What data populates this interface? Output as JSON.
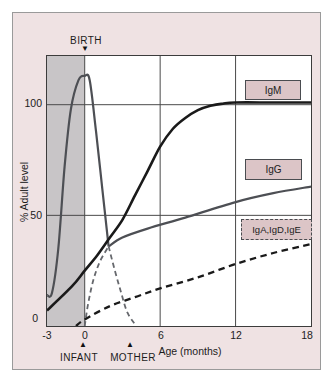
{
  "figure": {
    "markers": {
      "birth": {
        "label": "BIRTH",
        "icon": "▼"
      },
      "infant": {
        "label": "INFANT",
        "icon": "▲"
      },
      "mother": {
        "label": "MOTHER",
        "icon": "▲"
      }
    }
  },
  "axes": {
    "y_label": "% Adult level",
    "x_label": "Age (months)",
    "y_ticks": [
      "100",
      "50",
      "0"
    ],
    "x_ticks": [
      "-3",
      "0",
      "6",
      "12",
      "18"
    ]
  },
  "legend": [
    {
      "label": "IgM"
    },
    {
      "label": "IgG"
    },
    {
      "label": "IgA,IgD,IgE"
    }
  ],
  "colors": {
    "panel_bg": "#efe2e3",
    "prenatal_shade": "#c8c5c7",
    "grid": "#4a4a4a",
    "igm_line": "#1a1a1a",
    "igg_line": "#4d4f54",
    "dashed_gray": "#66686d",
    "legend_fill": "#dcc5c7"
  },
  "chart_data": {
    "type": "line",
    "xlabel": "Age (months)",
    "ylabel": "% Adult level",
    "xlim": [
      -3,
      18
    ],
    "ylim": [
      0,
      122
    ],
    "grid_x": [
      0,
      6,
      12
    ],
    "grid_y": [
      50,
      100
    ],
    "shade": {
      "x0": -3,
      "x1": 0,
      "color": "#c8c5c7",
      "note": "prenatal period before birth"
    },
    "annotations": [
      {
        "text": "BIRTH",
        "x": 0,
        "position": "top"
      },
      {
        "text": "INFANT",
        "x": 0,
        "position": "bottom"
      },
      {
        "text": "MOTHER",
        "x": 4.2,
        "position": "bottom"
      }
    ],
    "series": [
      {
        "name": "IgG (maternal, prenatal peak)",
        "color": "#4d4f54",
        "width": 2.2,
        "dash": null,
        "x": [
          -3,
          -2.6,
          -2.1,
          -1.6,
          -1.1,
          -0.5,
          0,
          0.4,
          0.9,
          1.4,
          1.9
        ],
        "y": [
          14,
          15,
          35,
          72,
          98,
          111,
          113,
          111,
          88,
          62,
          36
        ]
      },
      {
        "name": "IgM",
        "color": "#1a1a1a",
        "width": 2.6,
        "dash": null,
        "x": [
          -3,
          -1,
          0,
          1,
          2,
          3,
          4,
          5,
          6,
          7,
          8,
          9,
          10,
          11,
          12,
          15,
          18
        ],
        "y": [
          7,
          18,
          25,
          32,
          40,
          48,
          59,
          70,
          81,
          89,
          94,
          97.5,
          99.5,
          100.5,
          101,
          101,
          101
        ]
      },
      {
        "name": "IgG",
        "color": "#4d4f54",
        "width": 2.2,
        "dash": null,
        "x": [
          1.9,
          3,
          5,
          8,
          12,
          15,
          18
        ],
        "y": [
          36,
          40,
          44,
          49,
          56,
          60,
          63
        ]
      },
      {
        "name": "IgG (infant production)",
        "color": "#66686d",
        "width": 1.8,
        "dash": "5 3.5",
        "x": [
          0,
          0.3,
          0.7,
          1.2,
          1.9
        ],
        "y": [
          0,
          11,
          21,
          29,
          36
        ]
      },
      {
        "name": "IgG (maternal decline)",
        "color": "#66686d",
        "width": 1.8,
        "dash": "5 3.5",
        "x": [
          1.9,
          2.4,
          2.9,
          3.4,
          4.1
        ],
        "y": [
          36,
          25,
          15,
          6,
          0
        ]
      },
      {
        "name": "IgA,IgD,IgE",
        "color": "#1a1a1a",
        "width": 2.3,
        "dash": "6.5 4.5",
        "x": [
          -0.7,
          0,
          2,
          4,
          6,
          9,
          12,
          15,
          18
        ],
        "y": [
          0,
          3,
          9,
          13,
          17,
          22,
          28,
          33,
          37
        ]
      }
    ],
    "legend_position": "right"
  }
}
